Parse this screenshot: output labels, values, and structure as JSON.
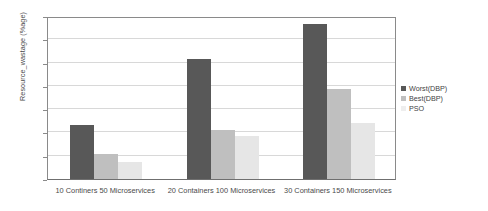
{
  "chart_data": {
    "type": "bar",
    "title": "",
    "xlabel": "",
    "ylabel": "Resource_wastage (%age)",
    "ylim": [
      0,
      35
    ],
    "yticks": [
      0,
      5,
      10,
      15,
      20,
      25,
      30,
      35
    ],
    "ytick_labels": [
      "0",
      "5",
      "10",
      "15",
      "20",
      "25",
      "30",
      "35"
    ],
    "grid": true,
    "legend_position": "right",
    "categories": [
      "10 Continers 50 Microservices",
      "20 Containers 100 Microservices",
      "30 Containers 150 Microservices"
    ],
    "series": [
      {
        "name": "Worst(DBP)",
        "color": "#585858",
        "values": [
          11.5,
          25.7,
          33.3
        ]
      },
      {
        "name": "Best(DBP)",
        "color": "#bfbfbf",
        "values": [
          5.4,
          10.6,
          19.3
        ]
      },
      {
        "name": "PSO",
        "color": "#e6e6e6",
        "values": [
          3.7,
          9.3,
          12.0
        ]
      }
    ]
  },
  "axes": {
    "y_title": "Resource_wastage (%age)"
  },
  "legend": {
    "entries": [
      {
        "label": "Worst(DBP)",
        "color": "#585858"
      },
      {
        "label": "Best(DBP)",
        "color": "#bfbfbf"
      },
      {
        "label": "PSO",
        "color": "#eeeeee"
      }
    ]
  },
  "colors": {
    "axis": "#8a8a8a",
    "grid": "#d8d8d8",
    "text": "#4a4a4a",
    "background": "#ffffff"
  }
}
